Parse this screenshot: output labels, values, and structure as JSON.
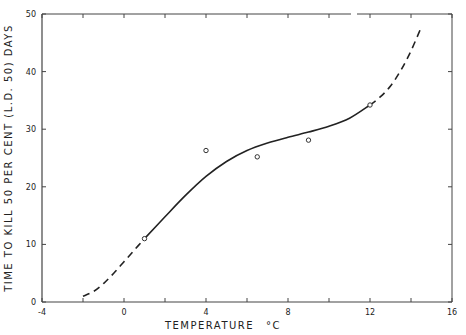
{
  "chart_data": {
    "type": "line",
    "title": "",
    "xlabel": "TEMPERATURE °C",
    "ylabel": "TIME TO KILL 50 PER CENT (L.D. 50) DAYS",
    "xlim": [
      -4,
      16
    ],
    "ylim": [
      0,
      50
    ],
    "x_ticks": [
      -4,
      0,
      4,
      8,
      12,
      16
    ],
    "x_minor_ticks": [
      -2,
      2,
      6,
      10,
      14
    ],
    "y_ticks": [
      0,
      10,
      20,
      30,
      40,
      50
    ],
    "grid": false,
    "legend": null,
    "series": [
      {
        "name": "observed",
        "kind": "scatter",
        "marker": "open-circle",
        "x": [
          1,
          4,
          6.5,
          9,
          12
        ],
        "y": [
          11,
          26.3,
          25.2,
          28.1,
          34.2
        ]
      },
      {
        "name": "fitted curve (solid)",
        "kind": "line",
        "style": "solid",
        "x": [
          1,
          2,
          3,
          4,
          5,
          6,
          7,
          8,
          9,
          10,
          11,
          12
        ],
        "y": [
          11,
          14.8,
          18.5,
          21.8,
          24.4,
          26.3,
          27.6,
          28.6,
          29.5,
          30.5,
          31.9,
          34.2
        ]
      },
      {
        "name": "extrapolation low (dashed)",
        "kind": "line",
        "style": "dashed",
        "x": [
          -2,
          -1.5,
          -1,
          -0.5,
          0,
          0.5,
          1
        ],
        "y": [
          1,
          1.8,
          3.2,
          5,
          7,
          9,
          11
        ]
      },
      {
        "name": "extrapolation high (dashed)",
        "kind": "line",
        "style": "dashed",
        "x": [
          12,
          12.5,
          13,
          13.5,
          14,
          14.5
        ],
        "y": [
          34.2,
          35.6,
          37.5,
          40.2,
          43.6,
          47.7
        ]
      }
    ]
  },
  "labels": {
    "xlabel_text": "TEMPERATURE",
    "xlabel_unit": "°C",
    "ylabel": "TIME TO KILL 50 PER CENT (L.D. 50) DAYS"
  }
}
